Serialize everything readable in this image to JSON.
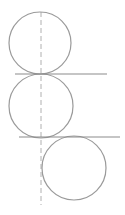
{
  "diagram": {
    "colors": {
      "background": "#ffffff",
      "circle_stroke": "#9a9a9a",
      "line_stroke": "#8c8c8c",
      "dashed_stroke": "#b0b0b0"
    },
    "dashed_axis": {
      "x": 41,
      "y1": 12,
      "y2": 205
    },
    "circles": [
      {
        "cx": 40,
        "cy": 43,
        "r": 31
      },
      {
        "cx": 41,
        "cy": 106,
        "r": 32
      },
      {
        "cx": 74,
        "cy": 168,
        "r": 32
      }
    ],
    "lines": [
      {
        "x1": 15,
        "y1": 74,
        "x2": 107,
        "y2": 74
      },
      {
        "x1": 19,
        "y1": 137,
        "x2": 120,
        "y2": 137
      }
    ]
  }
}
